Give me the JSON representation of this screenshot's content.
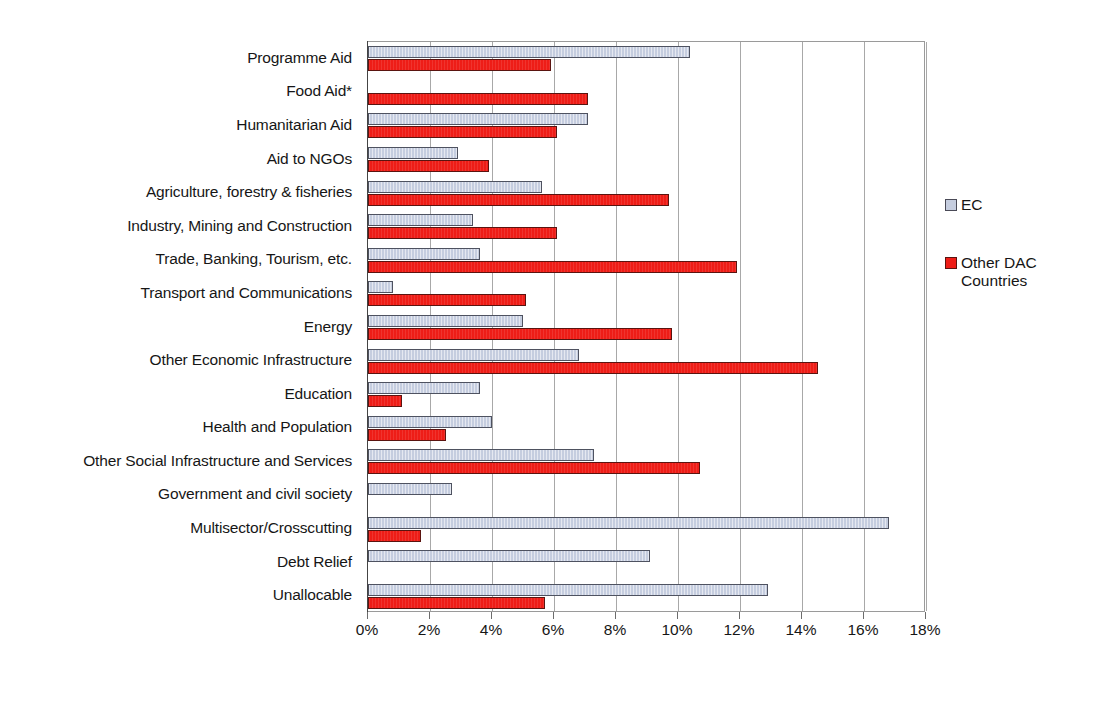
{
  "chart_data": {
    "type": "bar",
    "orientation": "horizontal",
    "title": "",
    "subtitle": "",
    "xlabel": "",
    "ylabel": "",
    "xlim": [
      0,
      18
    ],
    "xtick_labels": [
      "0%",
      "2%",
      "4%",
      "6%",
      "8%",
      "10%",
      "12%",
      "14%",
      "16%",
      "18%"
    ],
    "xtick_values": [
      0,
      2,
      4,
      6,
      8,
      10,
      12,
      14,
      16,
      18
    ],
    "grid": "vertical",
    "legend_position": "right",
    "categories": [
      "Programme Aid",
      "Food Aid*",
      "Humanitarian Aid",
      "Aid to NGOs",
      "Agriculture, forestry & fisheries",
      "Industry, Mining and Construction",
      "Trade, Banking, Tourism, etc.",
      "Transport and Communications",
      "Energy",
      "Other Economic Infrastructure",
      "Education",
      "Health and Population",
      "Other Social Infrastructure and Services",
      "Government and civil society",
      "Multisector/Crosscutting",
      "Debt Relief",
      "Unallocable"
    ],
    "series": [
      {
        "name": "EC",
        "color": "#c5cddf",
        "values": [
          10.4,
          0,
          7.1,
          2.9,
          5.6,
          3.4,
          3.6,
          0.8,
          5.0,
          6.8,
          3.6,
          4.0,
          7.3,
          2.7,
          16.8,
          9.1,
          12.9
        ]
      },
      {
        "name": "Other DAC Countries",
        "color": "#ee1d17",
        "values": [
          5.9,
          7.1,
          6.1,
          3.9,
          9.7,
          6.1,
          11.9,
          5.1,
          9.8,
          14.5,
          1.1,
          2.5,
          10.7,
          0,
          1.7,
          0,
          5.7
        ]
      }
    ]
  },
  "legend": {
    "items": [
      {
        "label": "EC",
        "swatch": "ec-swatch"
      },
      {
        "label": "Other DAC\nCountries",
        "swatch": "dac-swatch"
      }
    ]
  }
}
